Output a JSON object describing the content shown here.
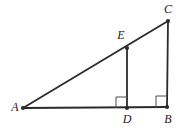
{
  "figure": {
    "background_color": "#ffffff",
    "stroke_color": "#2b2b2b",
    "label_color": "#1a1a1a",
    "width": 186,
    "height": 129
  },
  "points": [
    {
      "id": "A",
      "label": "A",
      "x": 23,
      "y": 108,
      "label_x": 15,
      "label_y": 107,
      "marker": true
    },
    {
      "id": "B",
      "label": "B",
      "x": 167,
      "y": 107,
      "label_x": 168,
      "label_y": 119,
      "marker": true
    },
    {
      "id": "C",
      "label": "C",
      "x": 168,
      "y": 21,
      "label_x": 168,
      "label_y": 9,
      "marker": true
    },
    {
      "id": "D",
      "label": "D",
      "x": 127,
      "y": 108,
      "label_x": 127,
      "label_y": 119,
      "marker": true
    },
    {
      "id": "E",
      "label": "E",
      "x": 127,
      "y": 48,
      "label_x": 121,
      "label_y": 35,
      "marker": true
    }
  ],
  "segments": [
    {
      "id": "AC",
      "name": "hypotenuse-ac",
      "from": "A",
      "to": "C",
      "x1": 23,
      "y1": 108,
      "x2": 168,
      "y2": 21,
      "width": 1.8
    },
    {
      "id": "AB",
      "name": "base-ab",
      "from": "A",
      "to": "B",
      "x1": 23,
      "y1": 108,
      "x2": 167,
      "y2": 107,
      "width": 1.8
    },
    {
      "id": "BC",
      "name": "leg-bc",
      "from": "B",
      "to": "C",
      "x1": 167,
      "y1": 107,
      "x2": 168,
      "y2": 21,
      "width": 1.8
    },
    {
      "id": "DE",
      "name": "altitude-de",
      "from": "D",
      "to": "E",
      "x1": 127,
      "y1": 108,
      "x2": 127,
      "y2": 48,
      "width": 1.8
    }
  ],
  "right_angles": [
    {
      "id": "angle-D",
      "vertex": "D",
      "x": 116,
      "y": 97,
      "size": 11
    },
    {
      "id": "angle-B",
      "vertex": "B",
      "x": 156,
      "y": 96,
      "size": 11
    }
  ],
  "marker_radius": 2.1
}
